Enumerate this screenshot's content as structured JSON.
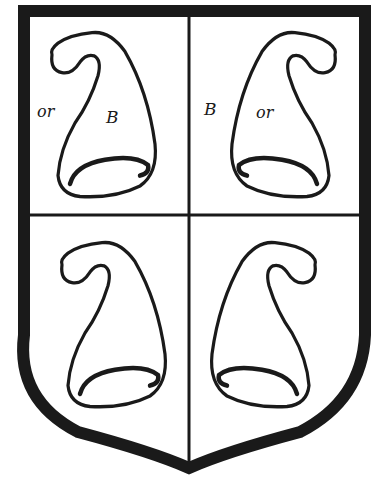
{
  "figure": {
    "colors": {
      "ink": "#1a1a1a",
      "field": "#ffffff"
    },
    "quarters": [
      {
        "position": "top-left",
        "charge": "phrygian-cap",
        "facing": "left",
        "labels": [
          {
            "text": "or",
            "role": "field-tincture"
          },
          {
            "text": "B",
            "role": "charge-tincture"
          }
        ]
      },
      {
        "position": "top-right",
        "charge": "phrygian-cap",
        "facing": "right",
        "labels": [
          {
            "text": "B",
            "role": "field-tincture"
          },
          {
            "text": "or",
            "role": "charge-tincture"
          }
        ]
      },
      {
        "position": "bottom-left",
        "charge": "phrygian-cap",
        "facing": "left",
        "labels": []
      },
      {
        "position": "bottom-right",
        "charge": "phrygian-cap",
        "facing": "right",
        "labels": []
      }
    ]
  }
}
